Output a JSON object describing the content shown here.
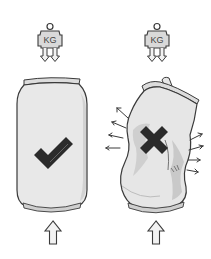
{
  "diagram": {
    "panels": [
      {
        "id": "intact",
        "weight_label": "KG",
        "can_state": "intact",
        "mark": "checkmark",
        "mark_icon": "check-icon",
        "force_arrow": "up-arrow-icon"
      },
      {
        "id": "crushed",
        "weight_label": "KG",
        "can_state": "crushed",
        "mark": "cross",
        "mark_icon": "cross-icon",
        "force_arrow": "up-arrow-icon",
        "side_arrows": 8
      }
    ],
    "colors": {
      "outline": "#3a3a3a",
      "can_fill": "#e6e6e6",
      "can_shade": "#cfcfcf",
      "mark": "#2b2b2b",
      "weight_fill": "#d9d9d9",
      "arrow_fill": "#f2f2f2"
    }
  }
}
